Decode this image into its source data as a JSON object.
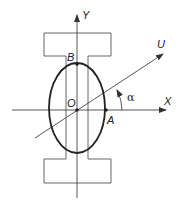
{
  "diagram": {
    "labels": {
      "y_axis": "Y",
      "x_axis": "X",
      "u_axis": "U",
      "origin": "O",
      "point_a": "A",
      "point_b": "B",
      "angle": "α"
    },
    "colors": {
      "stroke": "#555555",
      "ellipse": "#222222",
      "text": "#222222"
    }
  }
}
